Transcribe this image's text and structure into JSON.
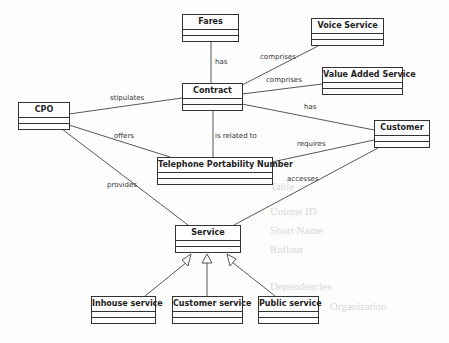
{
  "diagram": {
    "type": "UML class diagram",
    "classes": [
      {
        "id": "fares",
        "name": "Fares"
      },
      {
        "id": "voice_service",
        "name": "Voice Service"
      },
      {
        "id": "value_added_service",
        "name": "Value Added Service"
      },
      {
        "id": "contract",
        "name": "Contract"
      },
      {
        "id": "cpo",
        "name": "CPO"
      },
      {
        "id": "customer",
        "name": "Customer"
      },
      {
        "id": "telephone_portability_number",
        "name": "Telephone Portability Number"
      },
      {
        "id": "service",
        "name": "Service"
      },
      {
        "id": "inhouse_service",
        "name": "Inhouse service"
      },
      {
        "id": "customer_service",
        "name": "Customer service"
      },
      {
        "id": "public_service",
        "name": "Public service"
      }
    ],
    "associations": [
      {
        "from": "contract",
        "to": "fares",
        "label": "has"
      },
      {
        "from": "contract",
        "to": "voice_service",
        "label": "comprises"
      },
      {
        "from": "contract",
        "to": "value_added_service",
        "label": "comprises"
      },
      {
        "from": "cpo",
        "to": "contract",
        "label": "stipulates"
      },
      {
        "from": "contract",
        "to": "customer",
        "label": "has"
      },
      {
        "from": "cpo",
        "to": "telephone_portability_number",
        "label": "offers"
      },
      {
        "from": "contract",
        "to": "telephone_portability_number",
        "label": "is related to"
      },
      {
        "from": "customer",
        "to": "telephone_portability_number",
        "label": "requires"
      },
      {
        "from": "cpo",
        "to": "service",
        "label": "provides"
      },
      {
        "from": "customer",
        "to": "service",
        "label": "accesses"
      }
    ],
    "generalizations": [
      {
        "child": "inhouse_service",
        "parent": "service"
      },
      {
        "child": "customer_service",
        "parent": "service"
      },
      {
        "child": "public_service",
        "parent": "service"
      }
    ]
  },
  "background_bleed_text": [
    "Table",
    "Unique ID",
    "Short Name",
    "Rollout",
    "CPO Contract",
    "Telephone",
    "Fulfilment",
    "Public service",
    "Dependencies",
    "Organisation"
  ]
}
